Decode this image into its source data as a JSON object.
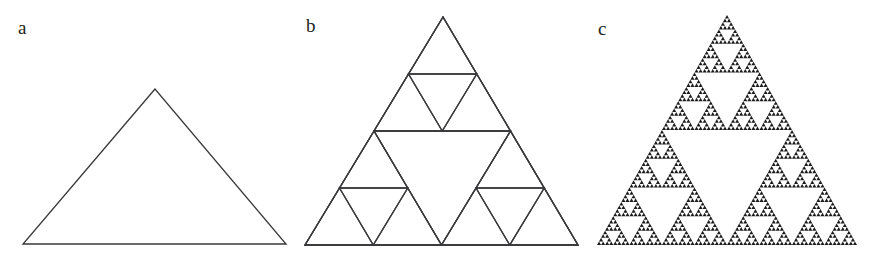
{
  "figure": {
    "background_color": "#ffffff",
    "stroke_color": "#3a3a3c",
    "fill_color": "#1c1c1e",
    "width": 876,
    "height": 253
  },
  "panels": [
    {
      "id": "a",
      "label": "a",
      "caption": "Initial equilateral triangle (iteration 0), drawn as an outline",
      "render": "outline",
      "iterations": 0,
      "triangle": {
        "apex": [
          155,
          89
        ],
        "bottom_left": [
          23,
          244
        ],
        "bottom_right": [
          286,
          244
        ]
      }
    },
    {
      "id": "b",
      "label": "b",
      "caption": "Sierpinski triangle after two subdivisions (iteration 2), outlines only",
      "render": "outline",
      "iterations": 2,
      "triangle": {
        "apex": [
          443,
          17
        ],
        "bottom_left": [
          305,
          245
        ],
        "bottom_right": [
          578,
          245
        ]
      }
    },
    {
      "id": "c",
      "label": "c",
      "caption": "Sierpinski gasket at high iteration (iteration 6), filled",
      "render": "filled",
      "iterations": 6,
      "triangle": {
        "apex": [
          727,
          15
        ],
        "bottom_left": [
          597,
          245
        ],
        "bottom_right": [
          857,
          245
        ]
      }
    }
  ]
}
